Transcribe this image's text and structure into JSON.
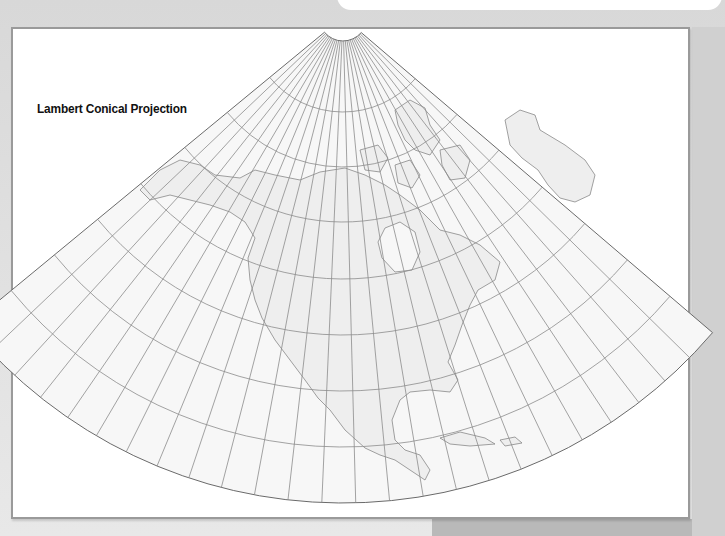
{
  "map": {
    "title": "Lambert Conical Projection",
    "projection": "lambert-conic",
    "region": "North America",
    "colors": {
      "background": "#dcdcdc",
      "frame_fill": "#ffffff",
      "frame_border": "#9a9a9a",
      "cone_fill": "#f7f7f7",
      "land_fill": "#eeeeee",
      "grid_line": "#8c8c8c",
      "coastline": "#7a7a7a",
      "outline": "#6a6a6a"
    },
    "cone": {
      "apex_x": 343,
      "apex_y": 17,
      "inner_radius": 24,
      "outer_radius": 486,
      "start_angle_deg": 40.5,
      "end_angle_deg": 140.5,
      "meridian_count": 25,
      "parallel_radii": [
        95,
        150,
        205,
        262,
        318,
        374,
        430
      ]
    }
  }
}
